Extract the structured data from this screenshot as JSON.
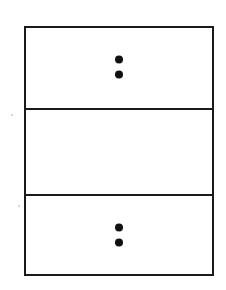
{
  "diagram": {
    "type": "stacked-boxes",
    "stroke_color": "#1a1a1a",
    "dot_color": "#111111",
    "background": "#ffffff",
    "sections": [
      {
        "name": "top-section",
        "content": "vertical-ellipsis",
        "symbol": "⁚"
      },
      {
        "name": "middle-section",
        "content": "empty",
        "symbol": ""
      },
      {
        "name": "bottom-section",
        "content": "vertical-ellipsis",
        "symbol": "⁚"
      }
    ]
  }
}
